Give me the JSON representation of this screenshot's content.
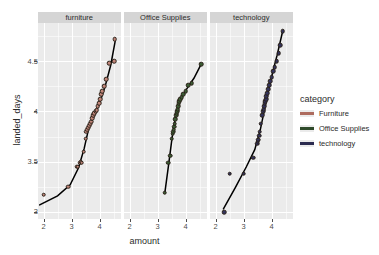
{
  "chart_data": {
    "type": "scatter",
    "title": "",
    "xlabel": "amount",
    "ylabel": "landed_days",
    "xlim": [
      1.8,
      4.75
    ],
    "ylim": [
      2.93,
      4.88
    ],
    "xticks": [
      2,
      3,
      4
    ],
    "yticks": [
      3,
      3.5,
      4,
      4.5
    ],
    "xtick_labels": [
      "2",
      "3",
      "4"
    ],
    "ytick_labels": [
      "3",
      "3.5",
      "4",
      "4.5"
    ],
    "grid": true,
    "grid_major_color": "#ffffff",
    "panel_background": "#ebebeb",
    "facet_variable": "category",
    "legend": {
      "title": "category",
      "position": "right",
      "entries": [
        {
          "label": "Furniture",
          "color": "#ad6b5e"
        },
        {
          "label": "Office Supplies",
          "color": "#2e4a2a"
        },
        {
          "label": "technology",
          "color": "#2b2b4f"
        }
      ]
    },
    "trend_line_color": "#000000",
    "point_stroke_color": "#2a2118",
    "panels": [
      {
        "strip_label": "furniture",
        "color": "#c08579",
        "points": [
          [
            2.0,
            3.17
          ],
          [
            2.88,
            3.25
          ],
          [
            3.18,
            3.45
          ],
          [
            3.22,
            3.45
          ],
          [
            3.3,
            3.49
          ],
          [
            3.33,
            3.5
          ],
          [
            3.36,
            3.49
          ],
          [
            3.44,
            3.6
          ],
          [
            3.5,
            3.73
          ],
          [
            3.52,
            3.8
          ],
          [
            3.56,
            3.82
          ],
          [
            3.6,
            3.84
          ],
          [
            3.63,
            3.86
          ],
          [
            3.66,
            3.88
          ],
          [
            3.7,
            3.9
          ],
          [
            3.74,
            3.93
          ],
          [
            3.78,
            3.96
          ],
          [
            3.82,
            3.98
          ],
          [
            3.86,
            4.0
          ],
          [
            3.9,
            4.01
          ],
          [
            3.94,
            4.05
          ],
          [
            3.98,
            4.08
          ],
          [
            4.02,
            4.12
          ],
          [
            4.06,
            4.17
          ],
          [
            4.1,
            4.2
          ],
          [
            4.16,
            4.25
          ],
          [
            4.24,
            4.32
          ],
          [
            4.34,
            4.48
          ],
          [
            4.52,
            4.5
          ],
          [
            4.54,
            4.72
          ]
        ],
        "trend": [
          [
            1.86,
            3.07
          ],
          [
            2.5,
            3.16
          ],
          [
            2.95,
            3.27
          ],
          [
            3.25,
            3.44
          ],
          [
            3.45,
            3.63
          ],
          [
            3.62,
            3.84
          ],
          [
            3.8,
            3.95
          ],
          [
            4.0,
            4.08
          ],
          [
            4.2,
            4.25
          ],
          [
            4.4,
            4.46
          ],
          [
            4.56,
            4.7
          ]
        ]
      },
      {
        "strip_label": "Office Supplies",
        "color": "#3b5c34",
        "points": [
          [
            3.26,
            3.19
          ],
          [
            3.38,
            3.49
          ],
          [
            3.46,
            3.56
          ],
          [
            3.5,
            3.73
          ],
          [
            3.54,
            3.78
          ],
          [
            3.56,
            3.8
          ],
          [
            3.58,
            3.82
          ],
          [
            3.6,
            3.85
          ],
          [
            3.62,
            3.88
          ],
          [
            3.64,
            3.92
          ],
          [
            3.66,
            3.96
          ],
          [
            3.68,
            3.98
          ],
          [
            3.7,
            4.0
          ],
          [
            3.72,
            4.02
          ],
          [
            3.74,
            4.05
          ],
          [
            3.76,
            4.08
          ],
          [
            3.78,
            4.1
          ],
          [
            3.82,
            4.12
          ],
          [
            3.86,
            4.14
          ],
          [
            3.92,
            4.17
          ],
          [
            4.0,
            4.2
          ],
          [
            4.1,
            4.26
          ],
          [
            4.22,
            4.28
          ],
          [
            4.56,
            4.47
          ]
        ],
        "trend": [
          [
            3.26,
            3.19
          ],
          [
            3.4,
            3.48
          ],
          [
            3.52,
            3.74
          ],
          [
            3.6,
            3.88
          ],
          [
            3.68,
            3.98
          ],
          [
            3.78,
            4.1
          ],
          [
            3.9,
            4.16
          ],
          [
            4.1,
            4.25
          ],
          [
            4.3,
            4.33
          ],
          [
            4.56,
            4.47
          ]
        ]
      },
      {
        "strip_label": "technology",
        "color": "#33335c",
        "points": [
          [
            2.3,
            3.0
          ],
          [
            2.5,
            3.38
          ],
          [
            3.0,
            3.38
          ],
          [
            3.35,
            3.54
          ],
          [
            3.48,
            3.68
          ],
          [
            3.5,
            3.7
          ],
          [
            3.52,
            3.72
          ],
          [
            3.55,
            3.76
          ],
          [
            3.58,
            3.8
          ],
          [
            3.62,
            3.88
          ],
          [
            3.66,
            3.96
          ],
          [
            3.7,
            4.0
          ],
          [
            3.72,
            4.02
          ],
          [
            3.74,
            4.05
          ],
          [
            3.76,
            4.08
          ],
          [
            3.78,
            4.1
          ],
          [
            3.8,
            4.12
          ],
          [
            3.82,
            4.15
          ],
          [
            3.84,
            4.18
          ],
          [
            3.88,
            4.22
          ],
          [
            3.92,
            4.26
          ],
          [
            3.96,
            4.3
          ],
          [
            4.0,
            4.34
          ],
          [
            4.06,
            4.4
          ],
          [
            4.12,
            4.44
          ],
          [
            4.18,
            4.5
          ],
          [
            4.26,
            4.58
          ],
          [
            4.32,
            4.66
          ],
          [
            4.4,
            4.8
          ]
        ],
        "trend": [
          [
            2.28,
            3.03
          ],
          [
            2.7,
            3.24
          ],
          [
            3.1,
            3.45
          ],
          [
            3.4,
            3.62
          ],
          [
            3.6,
            3.82
          ],
          [
            3.75,
            4.02
          ],
          [
            3.9,
            4.22
          ],
          [
            4.05,
            4.4
          ],
          [
            4.2,
            4.56
          ],
          [
            4.4,
            4.8
          ]
        ]
      }
    ]
  }
}
